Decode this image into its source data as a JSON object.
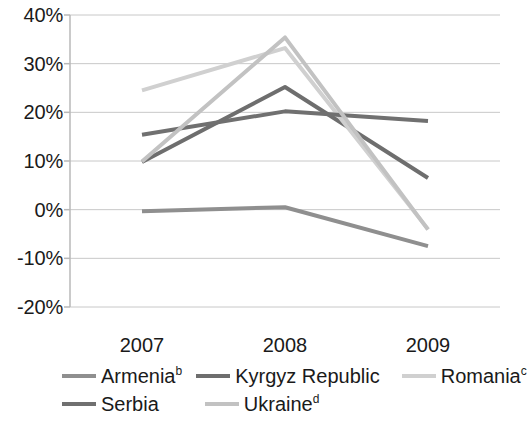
{
  "chart_data": {
    "type": "line",
    "title": "",
    "subtitle": "",
    "xlabel": "",
    "ylabel": "",
    "categories": [
      "2007",
      "2008",
      "2009"
    ],
    "x": [
      2007,
      2008,
      2009
    ],
    "ylim": [
      -20,
      40
    ],
    "ytick_labels": [
      "40%",
      "30%",
      "20%",
      "10%",
      "0%",
      "-10%",
      "-20%"
    ],
    "ytick_values": [
      40,
      30,
      20,
      10,
      0,
      -10,
      -20
    ],
    "grid": true,
    "grid_axis": "y",
    "legend_position": "bottom",
    "value_unit": "%",
    "series": [
      {
        "name": "Armenia",
        "name_superscript": "b",
        "color": "#8f8f8f",
        "values": [
          -0.3,
          0.5,
          -7.5
        ]
      },
      {
        "name": "Kyrgyz Republic",
        "name_superscript": "",
        "color": "#6e6e6e",
        "values": [
          9.8,
          25.2,
          6.5
        ]
      },
      {
        "name": "Romania",
        "name_superscript": "c",
        "color": "#d0d0d0",
        "values": [
          24.5,
          33.2,
          -4.0
        ]
      },
      {
        "name": "Serbia",
        "name_superscript": "",
        "color": "#707070",
        "values": [
          15.4,
          20.2,
          18.2
        ]
      },
      {
        "name": "Ukraine",
        "name_superscript": "d",
        "color": "#c2c2c2",
        "values": [
          9.9,
          35.4,
          -4.1
        ]
      }
    ]
  },
  "axis": {
    "y_labels": [
      "40%",
      "30%",
      "20%",
      "10%",
      "0%",
      "-10%",
      "-20%"
    ],
    "x_labels": [
      "2007",
      "2008",
      "2009"
    ]
  },
  "legend": {
    "row0": [
      {
        "label": "Armenia",
        "sup": "b",
        "color": "#8f8f8f"
      },
      {
        "label": "Kyrgyz Republic",
        "sup": "",
        "color": "#6e6e6e"
      },
      {
        "label": "Romania",
        "sup": "c",
        "color": "#d0d0d0"
      }
    ],
    "row1": [
      {
        "label": "Serbia",
        "sup": "",
        "color": "#707070"
      },
      {
        "label": "Ukraine",
        "sup": "d",
        "color": "#c2c2c2"
      }
    ]
  },
  "colors": {
    "axis_line": "#b8b8b8",
    "grid_line": "#c8c8c8",
    "text": "#1a1a1a",
    "background": "#ffffff"
  }
}
